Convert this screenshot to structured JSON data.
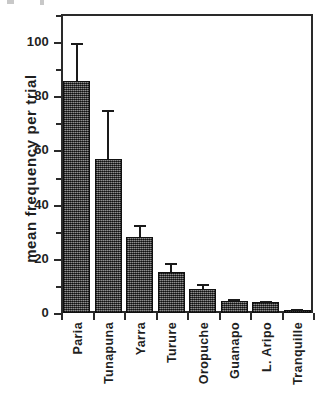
{
  "chart_data": {
    "type": "bar",
    "title": "",
    "xlabel": "",
    "ylabel": "mean frequency per trial",
    "categories": [
      "Paria",
      "Tunapuna",
      "Yarra",
      "Turure",
      "Oropuche",
      "Guanapo",
      "L. Aripo",
      "Tranquille"
    ],
    "values": [
      85.5,
      57,
      28,
      15,
      8.8,
      4.3,
      4.0,
      1.0
    ],
    "errors_upper": [
      99.5,
      75,
      32.5,
      18.5,
      10.8,
      5.0,
      4.6,
      1.4
    ],
    "error_type": "upper-only standard error bar",
    "ylim": [
      0,
      110
    ],
    "yticks_major": [
      0,
      20,
      40,
      60,
      80,
      100
    ],
    "yticks_minor": [
      10,
      30,
      50,
      70,
      90,
      110
    ],
    "ytick_labels": [
      "0",
      "20",
      "40",
      "60",
      "80",
      "100"
    ],
    "grid": false,
    "legend": "none",
    "bar_fill_color": "#4a4a4a",
    "bar_edge_color": "#111111",
    "axis_color": "#2a2a2a",
    "background_color": "#ffffff"
  },
  "figure": {
    "axis_title_y": "mean frequency per trial"
  }
}
